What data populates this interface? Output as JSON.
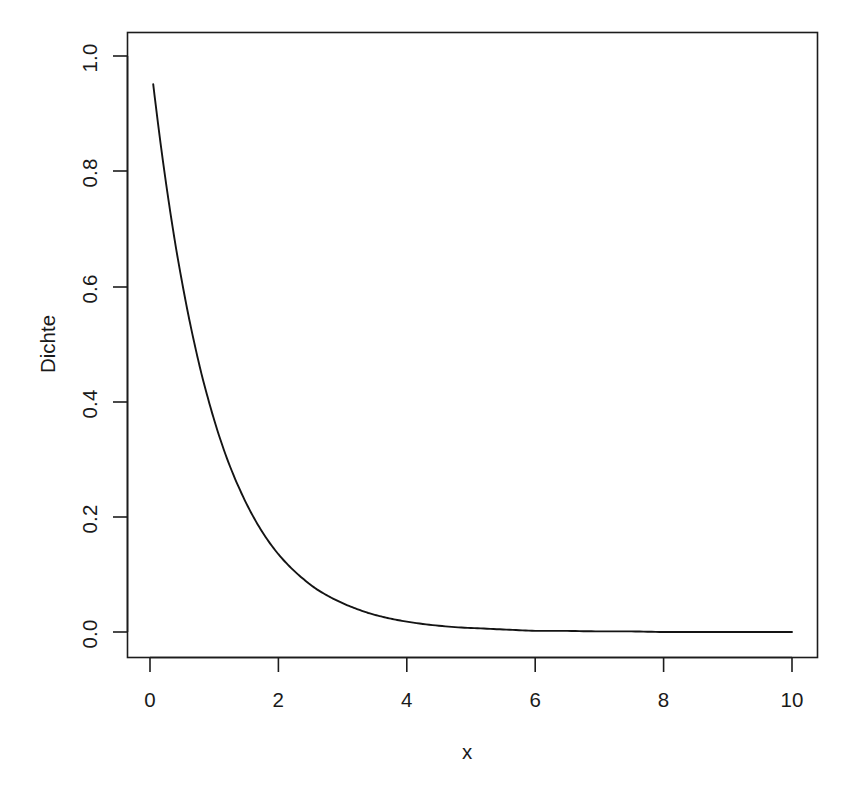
{
  "chart_data": {
    "type": "line",
    "title": "",
    "subtitle": "",
    "xlabel": "x",
    "ylabel": "Dichte",
    "xlim": [
      0,
      10
    ],
    "ylim": [
      0.0,
      1.0
    ],
    "grid": false,
    "legend": null,
    "legend_position": "none",
    "annotations": [],
    "x_ticks": [
      {
        "value": 0,
        "label": "0"
      },
      {
        "value": 2,
        "label": "2"
      },
      {
        "value": 4,
        "label": "4"
      },
      {
        "value": 6,
        "label": "6"
      },
      {
        "value": 8,
        "label": "8"
      },
      {
        "value": 10,
        "label": "10"
      }
    ],
    "y_ticks": [
      {
        "value": 0.0,
        "label": "0.0"
      },
      {
        "value": 0.2,
        "label": "0.2"
      },
      {
        "value": 0.4,
        "label": "0.4"
      },
      {
        "value": 0.6,
        "label": "0.6"
      },
      {
        "value": 0.8,
        "label": "0.8"
      },
      {
        "value": 1.0,
        "label": "1.0"
      }
    ],
    "series": [
      {
        "name": "Dichte",
        "function": "exp(-x)",
        "color": "#141414",
        "x": [
          0.05,
          0.1,
          0.2,
          0.3,
          0.4,
          0.5,
          0.6,
          0.7,
          0.8,
          0.9,
          1.0,
          1.2,
          1.4,
          1.6,
          1.8,
          2.0,
          2.2,
          2.4,
          2.6,
          2.8,
          3.0,
          3.2,
          3.4,
          3.6,
          3.8,
          4.0,
          4.4,
          4.8,
          5.2,
          5.6,
          6.0,
          6.5,
          7.0,
          7.5,
          8.0,
          8.5,
          9.0,
          9.5,
          10.0
        ],
        "values": [
          0.951,
          0.905,
          0.819,
          0.741,
          0.67,
          0.607,
          0.549,
          0.497,
          0.449,
          0.407,
          0.368,
          0.301,
          0.247,
          0.202,
          0.165,
          0.135,
          0.111,
          0.091,
          0.074,
          0.061,
          0.05,
          0.041,
          0.033,
          0.027,
          0.022,
          0.018,
          0.012,
          0.008,
          0.006,
          0.004,
          0.002,
          0.002,
          0.001,
          0.001,
          0.0,
          0.0,
          0.0,
          0.0,
          0.0
        ]
      }
    ]
  },
  "axes": {
    "y_title": "Dichte",
    "x_title": "x"
  }
}
